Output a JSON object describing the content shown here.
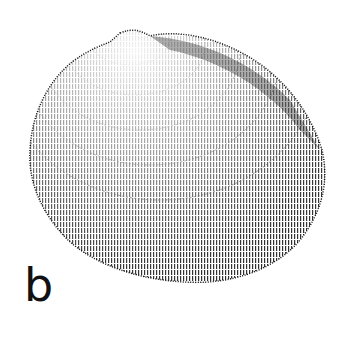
{
  "figure": {
    "panel_label": "b",
    "colors": {
      "ink": "#111111",
      "background": "#ffffff"
    }
  }
}
